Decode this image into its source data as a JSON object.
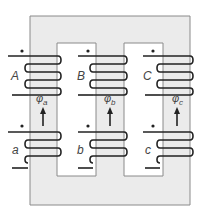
{
  "diagram": {
    "colors": {
      "core_fill": "#ebebeb",
      "core_edge": "#8a8a8a",
      "winding": "#222222",
      "label": "#444444"
    },
    "legs": [
      {
        "id": "a",
        "primary_label": "A",
        "secondary_label": "a",
        "flux_symbol": "φ",
        "flux_sub": "a"
      },
      {
        "id": "b",
        "primary_label": "B",
        "secondary_label": "b",
        "flux_symbol": "φ",
        "flux_sub": "b"
      },
      {
        "id": "c",
        "primary_label": "C",
        "secondary_label": "c",
        "flux_symbol": "φ",
        "flux_sub": "c"
      }
    ],
    "polarity_dot": "•"
  }
}
